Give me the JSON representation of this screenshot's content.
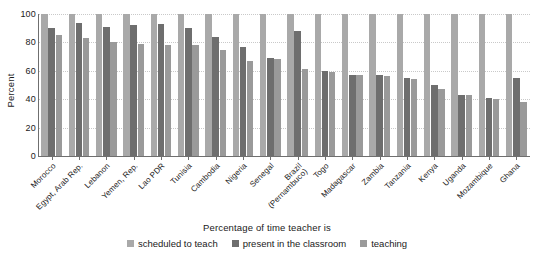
{
  "chart_data": {
    "type": "bar",
    "title": "",
    "xlabel": "",
    "ylabel": "Percent",
    "ylim": [
      0,
      100
    ],
    "yticks": [
      0,
      20,
      40,
      60,
      80,
      100
    ],
    "grid": true,
    "legend_position": "bottom",
    "legend_title": "Percentage of time teacher is",
    "categories": [
      "Morocco",
      "Egypt, Arab Rep.",
      "Lebanon",
      "Yemen, Rep.",
      "Lao PDR",
      "Tunisia",
      "Cambodia",
      "Nigeria",
      "Senegal",
      "Brazil (Pernambuco)",
      "Togo",
      "Madagascar",
      "Zambia",
      "Tanzania",
      "Kenya",
      "Uganda",
      "Mozambique",
      "Ghana"
    ],
    "series": [
      {
        "name": "scheduled to teach",
        "color": "#a9a9a9",
        "values": [
          100,
          100,
          100,
          100,
          100,
          100,
          100,
          100,
          100,
          100,
          100,
          100,
          100,
          100,
          100,
          100,
          100,
          100
        ]
      },
      {
        "name": "present in the classroom",
        "color": "#6e6e6e",
        "values": [
          90,
          94,
          91,
          92,
          93,
          90,
          84,
          77,
          69,
          88,
          60,
          57,
          57,
          55,
          50,
          43,
          41,
          55
        ]
      },
      {
        "name": "teaching",
        "color": "#9a9a9a",
        "values": [
          85,
          83,
          80,
          79,
          78,
          78,
          75,
          67,
          68,
          61,
          59,
          57,
          56,
          54,
          47,
          43,
          40,
          38
        ]
      }
    ]
  },
  "legend": {
    "title": "Percentage of time teacher is",
    "items": [
      {
        "label": "scheduled to teach",
        "color": "#a9a9a9"
      },
      {
        "label": "present in the classroom",
        "color": "#6e6e6e"
      },
      {
        "label": "teaching",
        "color": "#9a9a9a"
      }
    ]
  },
  "axes": {
    "y_title": "Percent",
    "y_tick_labels": [
      "100",
      "80",
      "60",
      "40",
      "20",
      "0"
    ]
  }
}
